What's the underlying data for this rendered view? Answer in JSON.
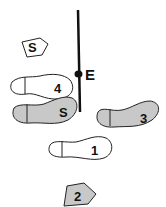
{
  "diagram": {
    "type": "footwork-step-diagram",
    "axis_line": {
      "label": "E",
      "color": "#111111"
    },
    "footprints": [
      {
        "id": "S_top",
        "label": "S",
        "kind": "partial-foot",
        "fill": "#ffffff"
      },
      {
        "id": "4",
        "label": "4",
        "kind": "full-foot",
        "fill": "#ffffff"
      },
      {
        "id": "S_left",
        "label": "S",
        "kind": "full-foot",
        "fill": "#c8c8c8"
      },
      {
        "id": "3",
        "label": "3",
        "kind": "full-foot",
        "fill": "#c8c8c8"
      },
      {
        "id": "1",
        "label": "1",
        "kind": "full-foot",
        "fill": "#ffffff"
      },
      {
        "id": "2",
        "label": "2",
        "kind": "partial-foot",
        "fill": "#c8c8c8"
      }
    ]
  }
}
